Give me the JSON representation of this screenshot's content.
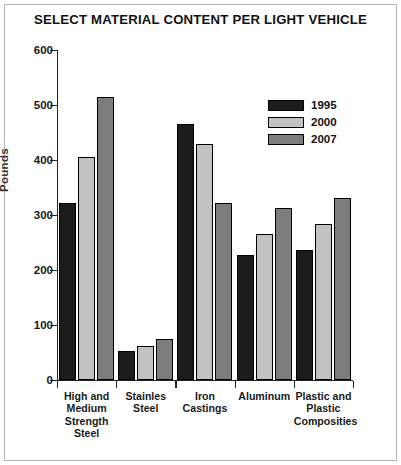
{
  "chart_data": {
    "type": "bar",
    "title": "SELECT MATERIAL CONTENT PER LIGHT VEHICLE",
    "xlabel": "",
    "ylabel": "Pounds",
    "ylim": [
      0,
      600
    ],
    "yticks": [
      0,
      100,
      200,
      300,
      400,
      500,
      600
    ],
    "ytick_labels": [
      "0",
      "100",
      "200",
      "300",
      "400",
      "500",
      "600"
    ],
    "grid": false,
    "legend_position": "upper right",
    "categories": [
      "High and Medium Strength Steel",
      "Stainles Steel",
      "Iron Castings",
      "Aluminum",
      "Plastic and Plastic Composities"
    ],
    "category_lines": [
      [
        "High and",
        "Medium",
        "Strength",
        "Steel"
      ],
      [
        "Stainles",
        "Steel"
      ],
      [
        "Iron",
        "Castings"
      ],
      [
        "Aluminum"
      ],
      [
        "Plastic and",
        "Plastic",
        "Composities"
      ]
    ],
    "series": [
      {
        "name": "1995",
        "color": "#1c1c1c",
        "values": [
          322,
          52,
          465,
          228,
          237
        ]
      },
      {
        "name": "2000",
        "color": "#c2c2c2",
        "values": [
          405,
          62,
          430,
          265,
          283
        ]
      },
      {
        "name": "2007",
        "color": "#7d7d7d",
        "values": [
          515,
          74,
          322,
          312,
          331
        ]
      }
    ]
  }
}
